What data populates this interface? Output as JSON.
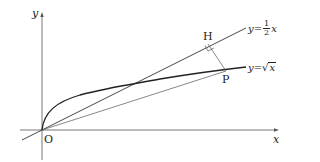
{
  "diagram": {
    "type": "coordinate-geometry",
    "axes": {
      "x_label": "x",
      "y_label": "y",
      "origin_label": "O"
    },
    "curves": [
      {
        "name": "line",
        "equation_lhs": "y=",
        "frac_num": "1",
        "frac_den": "2",
        "var": "x"
      },
      {
        "name": "sqrt",
        "equation_lhs": "y=",
        "sqrt_arg": "x"
      }
    ],
    "points": {
      "H": "H",
      "P": "P"
    },
    "annotations": [
      "Perpendicular from P to line y=1/2 x meets at H (right angle mark)",
      "Segment OP drawn"
    ]
  }
}
